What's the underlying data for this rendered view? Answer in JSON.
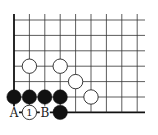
{
  "board": {
    "spacing": 15.4,
    "origin": {
      "x": 14,
      "y": 20
    },
    "cols": 9,
    "rows": 7,
    "right_extent": 145,
    "line_color": "#333333",
    "edge_color": "#111111"
  },
  "stones": {
    "white": [
      [
        1,
        3
      ],
      [
        3,
        3
      ],
      [
        4,
        4
      ],
      [
        5,
        5
      ]
    ],
    "black": [
      [
        0,
        5
      ],
      [
        1,
        5
      ],
      [
        2,
        5
      ],
      [
        3,
        5
      ],
      [
        3,
        6
      ]
    ],
    "numbered": [
      {
        "col": 1,
        "row": 6,
        "color": "white",
        "label": "1"
      }
    ]
  },
  "labels": [
    {
      "col": 0,
      "row": 6,
      "text": "A"
    },
    {
      "col": 2,
      "row": 6,
      "text": "B"
    }
  ]
}
